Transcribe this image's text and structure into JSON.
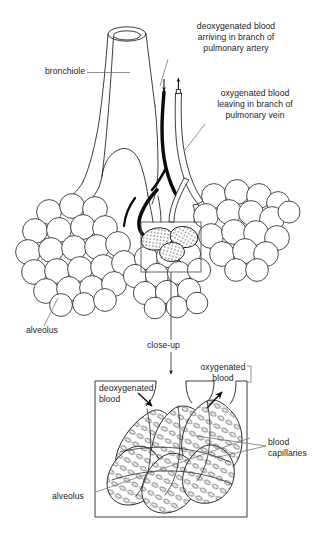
{
  "figure": {
    "background_color": "#ffffff",
    "ink_color": "#1a1a1a",
    "artery_color": "#000000",
    "vein_color": "#ffffff",
    "capillary_fill": "#d9d9d9"
  },
  "labels": {
    "bronchiole": "bronchiole",
    "deoxygenated_artery": "deoxygenated blood\narriving in branch of\npulmonary artery",
    "deoxygenated_artery_lines": [
      "deoxygenated blood",
      "arriving in branch of",
      "pulmonary artery"
    ],
    "oxygenated_vein": "oxygenated blood\nleaving in branch of\npulmonary vein",
    "oxygenated_vein_lines": [
      "oxygenated blood",
      "leaving in branch of",
      "pulmonary vein"
    ],
    "alveolus_main": "alveolus",
    "close_up": "close-up",
    "deoxygenated_blood": "deoxygenated\nblood",
    "deoxygenated_blood_lines": [
      "deoxygenated",
      "blood"
    ],
    "oxygenated_blood": "oxygenated\nblood",
    "oxygenated_blood_lines": [
      "oxygenated",
      "blood"
    ],
    "blood_capillaries": "blood\ncapillaries",
    "blood_capillaries_lines": [
      "blood",
      "capillaries"
    ],
    "alveolus_closeup": "alveolus"
  },
  "icons": {
    "arrow_down_artery": "arrow-down-icon",
    "arrow_up_vein": "arrow-up-icon",
    "arrow_closeup": "arrow-down-icon",
    "arrow_deoxy_closeup": "arrow-down-right-icon",
    "arrow_oxy_closeup": "arrow-up-right-icon"
  },
  "panels": {
    "closeup_box": {
      "name": "close-up detail panel",
      "x": 95,
      "y": 381,
      "width": 152,
      "height": 136
    },
    "highlight_box": {
      "name": "region magnified in close-up",
      "x": 141,
      "y": 222,
      "width": 60,
      "height": 50
    }
  }
}
